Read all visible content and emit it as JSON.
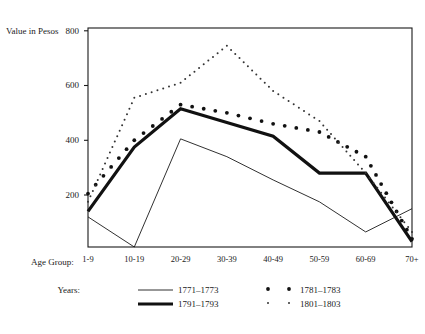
{
  "chart_data": {
    "type": "line",
    "title": "",
    "ylabel": "Value in Pesos",
    "xlabel": "Age Group:",
    "categories": [
      "1-9",
      "10-19",
      "20-29",
      "30-39",
      "40-49",
      "50-59",
      "60-69",
      "70+"
    ],
    "ylim": [
      0,
      800
    ],
    "yticks": [
      200,
      400,
      600,
      800
    ],
    "ytick_labels": [
      "200",
      "400",
      "600",
      "800"
    ],
    "grid": false,
    "legend_position": "below-axes",
    "legend_title": "Years:",
    "series": [
      {
        "name": "1771–1773",
        "style": "thin-line",
        "values": [
          110,
          0,
          395,
          330,
          245,
          165,
          55,
          140
        ]
      },
      {
        "name": "1791–1793",
        "style": "thick-line",
        "values": [
          130,
          365,
          505,
          455,
          405,
          270,
          270,
          20
        ]
      },
      {
        "name": "1781–1783",
        "style": "large-dots",
        "values": [
          195,
          390,
          520,
          490,
          450,
          420,
          330,
          30
        ]
      },
      {
        "name": "1801–1803",
        "style": "small-dots",
        "values": [
          165,
          545,
          600,
          735,
          570,
          460,
          270,
          55
        ]
      }
    ]
  },
  "axes": {
    "y_axis_title": "Value in Pesos",
    "x_axis_title": "Age Group:"
  },
  "legend": {
    "title": "Years:",
    "entries": [
      {
        "label": "1771–1773",
        "marker": "thin-line"
      },
      {
        "label": "1791–1793",
        "marker": "thick-line"
      },
      {
        "label": "1781–1783",
        "marker": "large-dots"
      },
      {
        "label": "1801–1803",
        "marker": "small-dots"
      }
    ]
  },
  "colors": {
    "ink": "#1a1a1a",
    "background": "#ffffff"
  }
}
